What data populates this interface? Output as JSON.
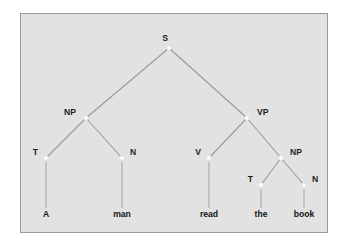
{
  "figure": {
    "kind": "syntax-tree",
    "sentence": "A man read the book",
    "panel_bg": "#e2e2e2",
    "panel_border": "#9b9b9b",
    "line_color": "#9a9a9a",
    "node_color": "#fdfdfd",
    "text_color": "#1d1d1d"
  },
  "nodes": [
    {
      "id": "s",
      "label": "S",
      "x": 148,
      "y": 34,
      "label_x": 144,
      "label_y": 27,
      "anchor": "middle"
    },
    {
      "id": "np1",
      "label": "NP",
      "x": 65,
      "y": 104,
      "label_x": 55,
      "label_y": 101,
      "anchor": "end"
    },
    {
      "id": "vp",
      "label": "VP",
      "x": 226,
      "y": 104,
      "label_x": 236,
      "label_y": 101,
      "anchor": "start"
    },
    {
      "id": "t1",
      "label": "T",
      "x": 25,
      "y": 144,
      "label_x": 17,
      "label_y": 141,
      "anchor": "end"
    },
    {
      "id": "n1",
      "label": "N",
      "x": 101,
      "y": 144,
      "label_x": 109,
      "label_y": 141,
      "anchor": "start"
    },
    {
      "id": "v",
      "label": "V",
      "x": 188,
      "y": 144,
      "label_x": 180,
      "label_y": 141,
      "anchor": "end"
    },
    {
      "id": "np2",
      "label": "NP",
      "x": 260,
      "y": 144,
      "label_x": 269,
      "label_y": 141,
      "anchor": "start"
    },
    {
      "id": "t2",
      "label": "T",
      "x": 240,
      "y": 171,
      "label_x": 232,
      "label_y": 168,
      "anchor": "end"
    },
    {
      "id": "n2",
      "label": "N",
      "x": 283,
      "y": 171,
      "label_x": 291,
      "label_y": 168,
      "anchor": "start"
    }
  ],
  "edges": [
    {
      "id": "s-np1",
      "from": "s",
      "to": "np1"
    },
    {
      "id": "s-vp",
      "from": "s",
      "to": "vp"
    },
    {
      "id": "np1-t1",
      "from": "np1",
      "to": "t1"
    },
    {
      "id": "np1-n1",
      "from": "np1",
      "to": "n1"
    },
    {
      "id": "vp-v",
      "from": "vp",
      "to": "v"
    },
    {
      "id": "vp-np2",
      "from": "vp",
      "to": "np2"
    },
    {
      "id": "np2-t2",
      "from": "np2",
      "to": "t2"
    },
    {
      "id": "np2-n2",
      "from": "np2",
      "to": "n2"
    }
  ],
  "leaves": [
    {
      "id": "leaf-a",
      "word": "A",
      "parent": "t1",
      "x": 25,
      "line_top": 148,
      "line_bottom": 194,
      "text_y": 203
    },
    {
      "id": "leaf-man",
      "word": "man",
      "parent": "n1",
      "x": 101,
      "line_top": 148,
      "line_bottom": 194,
      "text_y": 203
    },
    {
      "id": "leaf-read",
      "word": "read",
      "parent": "v",
      "x": 188,
      "line_top": 148,
      "line_bottom": 194,
      "text_y": 203
    },
    {
      "id": "leaf-the",
      "word": "the",
      "parent": "t2",
      "x": 240,
      "line_top": 175,
      "line_bottom": 194,
      "text_y": 203
    },
    {
      "id": "leaf-book",
      "word": "book",
      "parent": "n2",
      "x": 283,
      "line_top": 175,
      "line_bottom": 194,
      "text_y": 203
    }
  ]
}
